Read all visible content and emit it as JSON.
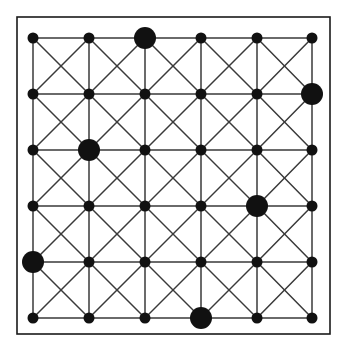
{
  "figure": {
    "type": "node-link-diagram",
    "width": 347,
    "height": 349,
    "background_color": "#ffffff"
  },
  "frame": {
    "name": "outer-border",
    "x": 17,
    "y": 17,
    "width": 313,
    "height": 317,
    "stroke_color": "#1a1a1a",
    "stroke_width": 1.6,
    "fill": "none"
  },
  "grid": {
    "rows": 6,
    "cols": 6,
    "col_x": [
      33,
      89,
      145,
      201,
      257,
      312
    ],
    "row_y": [
      38,
      94,
      150,
      206,
      262,
      318
    ],
    "spacing_x": 55.8,
    "spacing_y": 56.0
  },
  "edges": {
    "stroke_color": "#3a3a3a",
    "stroke_width": 1.5,
    "include_horizontal": true,
    "include_vertical": true,
    "include_diagonal_down": true,
    "include_diagonal_up": true,
    "description": "Every unit cell carries both diagonals forming an X, plus all row and column segments."
  },
  "nodes": {
    "fill_color": "#111111",
    "small_radius": 5.5,
    "large_radius": 11.0,
    "total_count": 36,
    "large_count": 7,
    "small_count": 29,
    "highlighted": [
      {
        "label": "top-center-large",
        "col": 2,
        "row": 0
      },
      {
        "label": "right-upper-large",
        "col": 5,
        "row": 1
      },
      {
        "label": "left-upper-large",
        "col": 1,
        "row": 2
      },
      {
        "label": "right-lower-large",
        "col": 4,
        "row": 3
      },
      {
        "label": "left-lower-large",
        "col": 0,
        "row": 4
      },
      {
        "label": "bottom-center-large",
        "col": 3,
        "row": 5
      }
    ],
    "highlighted_matrix": [
      [
        0,
        0,
        1,
        0,
        0,
        0
      ],
      [
        0,
        0,
        0,
        0,
        0,
        1
      ],
      [
        0,
        1,
        0,
        0,
        0,
        0
      ],
      [
        0,
        0,
        0,
        0,
        1,
        0
      ],
      [
        1,
        0,
        0,
        0,
        0,
        0
      ],
      [
        0,
        0,
        0,
        1,
        0,
        0
      ]
    ]
  },
  "chart_data": {
    "type": "scatter",
    "xlabel": "",
    "ylabel": "",
    "x": [
      0,
      1,
      2,
      3,
      4,
      5
    ],
    "categories": [
      "c0",
      "c1",
      "c2",
      "c3",
      "c4",
      "c5"
    ],
    "series": [
      {
        "name": "row-0",
        "values": [
          0,
          0,
          1,
          0,
          0,
          0
        ]
      },
      {
        "name": "row-1",
        "values": [
          0,
          0,
          0,
          0,
          0,
          1
        ]
      },
      {
        "name": "row-2",
        "values": [
          0,
          1,
          0,
          0,
          0,
          0
        ]
      },
      {
        "name": "row-3",
        "values": [
          0,
          0,
          0,
          0,
          1,
          0
        ]
      },
      {
        "name": "row-4",
        "values": [
          1,
          0,
          0,
          0,
          0,
          0
        ]
      },
      {
        "name": "row-5",
        "values": [
          0,
          0,
          0,
          1,
          0,
          0
        ]
      }
    ],
    "xlim": [
      0,
      5
    ],
    "ylim": [
      0,
      5
    ],
    "grid": true,
    "legend": "none",
    "note": "Value 1 = enlarged (highlighted) node, 0 = standard node. One highlighted node per row and per column."
  }
}
